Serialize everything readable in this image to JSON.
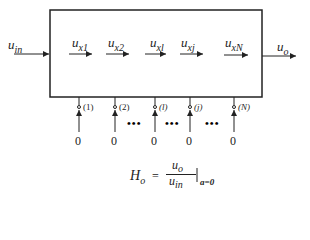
{
  "input": {
    "var": "u",
    "sub": "in"
  },
  "output": {
    "var": "u",
    "sub": "o"
  },
  "internal": [
    {
      "var": "u",
      "sub": "x1"
    },
    {
      "var": "u",
      "sub": "x2"
    },
    {
      "var": "u",
      "sub": "xl"
    },
    {
      "var": "u",
      "sub": "xj"
    },
    {
      "var": "u",
      "sub": "xN"
    }
  ],
  "injections": [
    {
      "label": "(1)",
      "value": "0"
    },
    {
      "label": "(2)",
      "value": "0"
    },
    {
      "label": "(l)",
      "value": "0"
    },
    {
      "label": "(j)",
      "value": "0"
    },
    {
      "label": "(N)",
      "value": "0"
    }
  ],
  "dots": "•••",
  "formula": {
    "lhs": "H",
    "lhs_sub": "o",
    "eq": "=",
    "num": "u",
    "num_sub": "o",
    "den": "u",
    "den_sub": "in",
    "cond": "a=0"
  }
}
